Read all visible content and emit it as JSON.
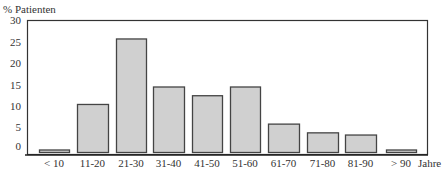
{
  "chart_data": {
    "type": "bar",
    "title": "",
    "ylabel": "% Patienten",
    "xlabel": "Jahre",
    "categories": [
      "< 10",
      "11-20",
      "21-30",
      "31-40",
      "41-50",
      "51-60",
      "61-70",
      "71-80",
      "81-90",
      "> 90"
    ],
    "values": [
      0.5,
      11,
      26,
      15,
      13,
      15,
      6.5,
      4.5,
      4,
      0.5
    ],
    "ylim": [
      0,
      30
    ],
    "yticks": [
      0,
      5,
      10,
      15,
      20,
      25,
      30
    ],
    "grid": false,
    "legend": null,
    "bar_color": "#d0d0d0",
    "bar_edge_color": "#444444"
  }
}
